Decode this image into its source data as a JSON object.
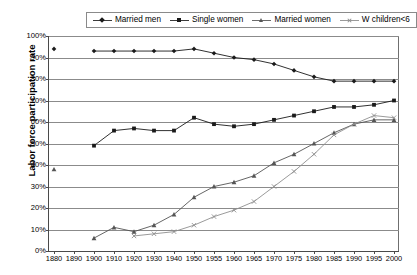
{
  "legend": {
    "position": "top-center",
    "entries": [
      {
        "label": "Married men",
        "marker": "diamond",
        "color": "#1a1a1a"
      },
      {
        "label": "Single women",
        "marker": "square",
        "color": "#1a1a1a"
      },
      {
        "label": "Married women",
        "marker": "triangle",
        "color": "#555555"
      },
      {
        "label": "W children<6",
        "marker": "x",
        "color": "#8e8e8e"
      }
    ]
  },
  "axes": {
    "ylabel": "Labor force participation rate",
    "xlabel": "",
    "yticks": [
      "0%",
      "10%",
      "20%",
      "30%",
      "40%",
      "50%",
      "60%",
      "70%",
      "80%",
      "90%",
      "100%"
    ],
    "xticks": [
      "1880",
      "1890",
      "1900",
      "1910",
      "1920",
      "1930",
      "1940",
      "1950",
      "1955",
      "1960",
      "1965",
      "1970",
      "1975",
      "1980",
      "1985",
      "1990",
      "1995",
      "2000"
    ]
  },
  "chart_data": {
    "type": "line",
    "title": "",
    "xlabel": "",
    "ylabel": "Labor force participation rate",
    "ylim": [
      0,
      100
    ],
    "grid": true,
    "legend_position": "top-center",
    "categories": [
      "1880",
      "1890",
      "1900",
      "1910",
      "1920",
      "1930",
      "1940",
      "1950",
      "1955",
      "1960",
      "1965",
      "1970",
      "1975",
      "1980",
      "1985",
      "1990",
      "1995",
      "2000"
    ],
    "series": [
      {
        "name": "Married men",
        "marker": "diamond",
        "color": "#1a1a1a",
        "values": [
          94,
          null,
          93,
          93,
          93,
          93,
          93,
          94,
          92,
          90,
          89,
          87,
          84,
          81,
          79,
          79,
          79,
          79
        ]
      },
      {
        "name": "Single women",
        "marker": "square",
        "color": "#1a1a1a",
        "values": [
          null,
          null,
          49,
          56,
          57,
          56,
          56,
          62,
          59,
          58,
          59,
          61,
          63,
          65,
          67,
          67,
          68,
          70
        ]
      },
      {
        "name": "Married women",
        "marker": "triangle",
        "color": "#555555",
        "values": [
          38,
          null,
          6,
          11,
          9,
          12,
          17,
          25,
          30,
          32,
          35,
          41,
          45,
          50,
          55,
          59,
          61,
          61
        ]
      },
      {
        "name": "W children<6",
        "marker": "x",
        "color": "#8e8e8e",
        "values": [
          null,
          null,
          null,
          null,
          7,
          8,
          9,
          12,
          16,
          19,
          23,
          30,
          37,
          45,
          54,
          59,
          63,
          62
        ]
      }
    ]
  }
}
